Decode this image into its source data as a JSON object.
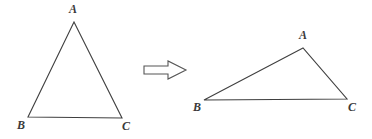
{
  "figure": {
    "background_color": "#ffffff",
    "stroke_color": "#3f3f3f",
    "stroke_width": 1.1,
    "label_color": "#3a3a3a",
    "arrow": {
      "name": "right-arrow",
      "outline_color": "#555555",
      "fill_color": "#ffffff",
      "points": "144,66 168,66 168,61 186,70 168,79 168,74 144,74"
    },
    "triangles": [
      {
        "id": "left-triangle",
        "name": "triangle-abc-original",
        "vertices": {
          "A": {
            "x": 74,
            "y": 22
          },
          "B": {
            "x": 28,
            "y": 117
          },
          "C": {
            "x": 122,
            "y": 118
          }
        },
        "labels": [
          {
            "text": "A",
            "x": 69,
            "y": 3
          },
          {
            "text": "B",
            "x": 17,
            "y": 119
          },
          {
            "text": "C",
            "x": 122,
            "y": 120
          }
        ]
      },
      {
        "id": "right-triangle",
        "name": "triangle-abc-transformed",
        "vertices": {
          "A": {
            "x": 303,
            "y": 48
          },
          "B": {
            "x": 204,
            "y": 100
          },
          "C": {
            "x": 347,
            "y": 99
          }
        },
        "labels": [
          {
            "text": "A",
            "x": 299,
            "y": 29
          },
          {
            "text": "B",
            "x": 193,
            "y": 101
          },
          {
            "text": "C",
            "x": 348,
            "y": 101
          }
        ]
      }
    ]
  }
}
